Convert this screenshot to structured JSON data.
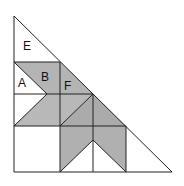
{
  "figure": {
    "colors": {
      "shade": "#b4b4b4",
      "shade_dark": "#aaaaaa",
      "line": "#222222",
      "background": "#ffffff"
    },
    "labels": [
      {
        "id": "E",
        "text": "E"
      },
      {
        "id": "B",
        "text": "B"
      },
      {
        "id": "A",
        "text": "A"
      },
      {
        "id": "F",
        "text": "F"
      }
    ]
  }
}
